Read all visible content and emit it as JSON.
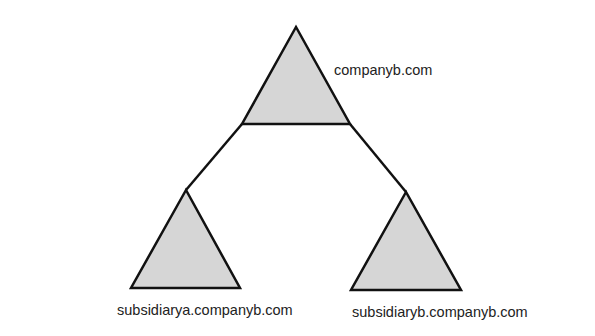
{
  "diagram": {
    "type": "domain-tree",
    "colors": {
      "fill": "#d6d6d6",
      "stroke": "#111111"
    },
    "root": {
      "label": "companyb.com"
    },
    "children": [
      {
        "label": "subsidiarya.companyb.com"
      },
      {
        "label": "subsidiaryb.companyb.com"
      }
    ]
  }
}
